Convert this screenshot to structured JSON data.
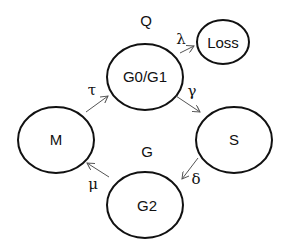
{
  "diagram": {
    "type": "state-transition",
    "group_labels": {
      "q": "Q",
      "g": "G"
    },
    "nodes": [
      {
        "id": "g0g1",
        "label": "G0/G1"
      },
      {
        "id": "loss",
        "label": "Loss"
      },
      {
        "id": "m",
        "label": "M"
      },
      {
        "id": "s",
        "label": "S"
      },
      {
        "id": "g2",
        "label": "G2"
      }
    ],
    "edges": [
      {
        "from": "g0g1",
        "to": "loss",
        "label": "λ"
      },
      {
        "from": "g0g1",
        "to": "s",
        "label": "γ"
      },
      {
        "from": "s",
        "to": "g2",
        "label": "δ"
      },
      {
        "from": "g2",
        "to": "m",
        "label": "μ"
      },
      {
        "from": "m",
        "to": "g0g1",
        "label": "τ"
      }
    ],
    "colors": {
      "stroke": "#111111",
      "arrow": "#555555",
      "background": "#ffffff"
    }
  }
}
